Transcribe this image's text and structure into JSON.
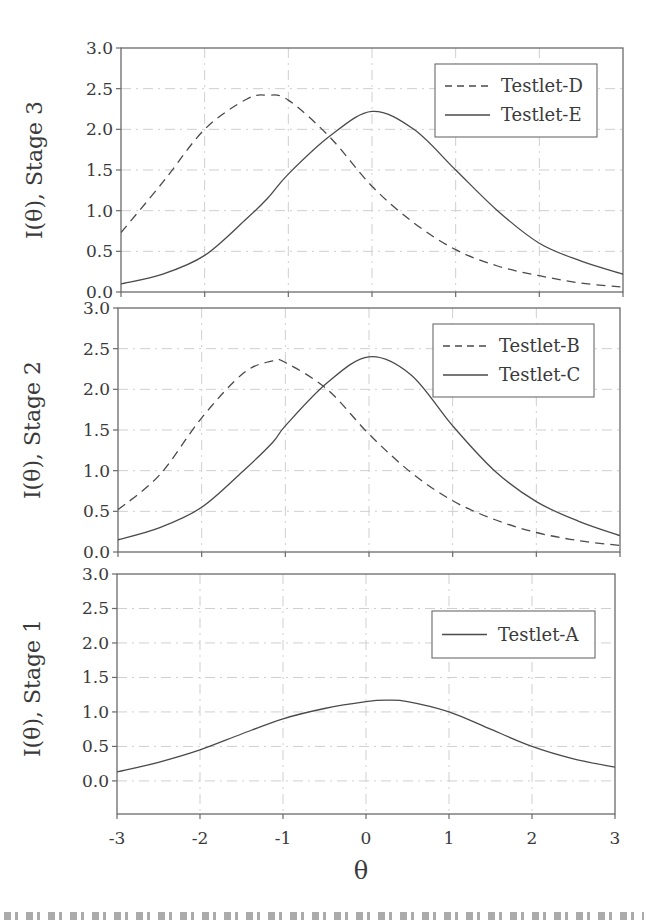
{
  "chart_data": [
    {
      "type": "line",
      "panel": "top",
      "ylabel": "I(θ), Stage 3",
      "xlabel": "",
      "xlim": [
        -3,
        3
      ],
      "ylim": [
        0,
        3
      ],
      "yticks": [
        "0.0",
        "0.5",
        "1.0",
        "1.5",
        "2.0",
        "2.5",
        "3.0"
      ],
      "grid": true,
      "legend_position": "upper right",
      "x": [
        -3,
        -2.5,
        -2,
        -1.5,
        -1.25,
        -1,
        -0.5,
        0,
        0.5,
        1,
        1.5,
        2,
        2.5,
        3
      ],
      "series": [
        {
          "name": "Testlet-D",
          "style": "dashed",
          "values": [
            0.73,
            1.35,
            2.0,
            2.37,
            2.42,
            2.36,
            1.9,
            1.3,
            0.85,
            0.52,
            0.32,
            0.2,
            0.11,
            0.06
          ]
        },
        {
          "name": "Testlet-E",
          "style": "solid",
          "values": [
            0.1,
            0.22,
            0.45,
            0.9,
            1.15,
            1.45,
            1.92,
            2.22,
            2.0,
            1.5,
            1.0,
            0.6,
            0.38,
            0.22
          ]
        }
      ]
    },
    {
      "type": "line",
      "panel": "middle",
      "ylabel": "I(θ), Stage 2",
      "xlabel": "",
      "xlim": [
        -3,
        3
      ],
      "ylim": [
        0,
        3
      ],
      "yticks": [
        "0.0",
        "0.5",
        "1.0",
        "1.5",
        "2.0",
        "2.5",
        "3.0"
      ],
      "grid": true,
      "legend_position": "upper right",
      "x": [
        -3,
        -2.5,
        -2,
        -1.5,
        -1.15,
        -1,
        -0.5,
        0,
        0.5,
        1,
        1.5,
        2,
        2.5,
        3
      ],
      "series": [
        {
          "name": "Testlet-B",
          "style": "dashed",
          "values": [
            0.52,
            0.95,
            1.65,
            2.2,
            2.35,
            2.33,
            2.0,
            1.45,
            0.98,
            0.63,
            0.4,
            0.24,
            0.14,
            0.08
          ]
        },
        {
          "name": "Testlet-C",
          "style": "solid",
          "values": [
            0.15,
            0.3,
            0.55,
            1.0,
            1.35,
            1.55,
            2.08,
            2.4,
            2.18,
            1.55,
            1.0,
            0.62,
            0.38,
            0.2
          ]
        }
      ]
    },
    {
      "type": "line",
      "panel": "bottom",
      "ylabel": "I(θ), Stage 1",
      "xlabel": "θ",
      "xlim": [
        -3,
        3
      ],
      "ylim": [
        -0.45,
        3
      ],
      "yticks": [
        "0.0",
        "0.5",
        "1.0",
        "1.5",
        "2.0",
        "2.5",
        "3.0"
      ],
      "xticks": [
        "-3",
        "-2",
        "-1",
        "0",
        "1",
        "2",
        "3"
      ],
      "grid": true,
      "legend_position": "upper right",
      "x": [
        -3,
        -2.5,
        -2,
        -1.5,
        -1,
        -0.5,
        0,
        0.25,
        0.5,
        1,
        1.5,
        2,
        2.5,
        3
      ],
      "series": [
        {
          "name": "Testlet-A",
          "style": "solid",
          "values": [
            0.13,
            0.27,
            0.45,
            0.68,
            0.9,
            1.05,
            1.15,
            1.17,
            1.15,
            1.0,
            0.75,
            0.5,
            0.32,
            0.2
          ]
        }
      ]
    }
  ],
  "panels": [
    {
      "ylabel": "I(θ), Stage 3",
      "legend": [
        "Testlet-D",
        "Testlet-E"
      ]
    },
    {
      "ylabel": "I(θ), Stage 2",
      "legend": [
        "Testlet-B",
        "Testlet-C"
      ]
    },
    {
      "ylabel": "I(θ), Stage 1",
      "legend": [
        "Testlet-A"
      ]
    }
  ],
  "x_axis": {
    "label": "θ",
    "ticks": [
      "-3",
      "-2",
      "-1",
      "0",
      "1",
      "2",
      "3"
    ]
  },
  "colors": {
    "line": "#4a4a4a",
    "axis": "#6a6a6a",
    "grid": "#cfcfcf",
    "text": "#3a3a3a"
  }
}
